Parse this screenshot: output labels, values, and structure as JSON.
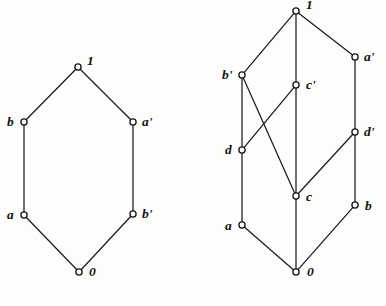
{
  "figure": {
    "background_color": "#fdfdfc",
    "line_color": "#1b1b1b",
    "node_fill": "#fdfdfc",
    "node_stroke": "#141414"
  },
  "diagrams": [
    {
      "id": "left-hexagon-lattice",
      "name": "left-lattice",
      "type": "hasse-diagram",
      "nodes": [
        {
          "id": "one",
          "label": "1",
          "x": 78,
          "y": 67,
          "label_dx": 9,
          "label_dy": -13
        },
        {
          "id": "b",
          "label": "b",
          "x": 24,
          "y": 122,
          "label_dx": -17,
          "label_dy": -7
        },
        {
          "id": "aprime",
          "label": "a'",
          "x": 133,
          "y": 122,
          "label_dx": 9,
          "label_dy": -7
        },
        {
          "id": "a",
          "label": "a",
          "x": 24,
          "y": 215,
          "label_dx": -17,
          "label_dy": -7
        },
        {
          "id": "bprime",
          "label": "b'",
          "x": 133,
          "y": 214,
          "label_dx": 9,
          "label_dy": -7
        },
        {
          "id": "zero",
          "label": "0",
          "x": 79,
          "y": 272,
          "label_dx": 10,
          "label_dy": -7
        }
      ],
      "edges": [
        [
          "b",
          "one"
        ],
        [
          "aprime",
          "one"
        ],
        [
          "b",
          "a"
        ],
        [
          "aprime",
          "bprime"
        ],
        [
          "a",
          "zero"
        ],
        [
          "bprime",
          "zero"
        ]
      ]
    },
    {
      "id": "right-lattice",
      "name": "right-lattice",
      "type": "hasse-diagram",
      "nodes": [
        {
          "id": "one",
          "label": "1",
          "x": 296,
          "y": 11,
          "label_dx": 10,
          "label_dy": -13
        },
        {
          "id": "aprime",
          "label": "a'",
          "x": 355,
          "y": 57,
          "label_dx": 9,
          "label_dy": -7
        },
        {
          "id": "bprime",
          "label": "b'",
          "x": 242,
          "y": 75,
          "label_dx": -20,
          "label_dy": -7
        },
        {
          "id": "cprime",
          "label": "c'",
          "x": 296,
          "y": 85,
          "label_dx": 10,
          "label_dy": -7
        },
        {
          "id": "dprime",
          "label": "d'",
          "x": 355,
          "y": 132,
          "label_dx": 9,
          "label_dy": -7
        },
        {
          "id": "d",
          "label": "d",
          "x": 242,
          "y": 150,
          "label_dx": -17,
          "label_dy": -7
        },
        {
          "id": "c",
          "label": "c",
          "x": 296,
          "y": 196,
          "label_dx": 10,
          "label_dy": -6
        },
        {
          "id": "b",
          "label": "b",
          "x": 355,
          "y": 205,
          "label_dx": 10,
          "label_dy": -6
        },
        {
          "id": "a",
          "label": "a",
          "x": 242,
          "y": 225,
          "label_dx": -17,
          "label_dy": -6
        },
        {
          "id": "zero",
          "label": "0",
          "x": 296,
          "y": 272,
          "label_dx": 11,
          "label_dy": -7
        }
      ],
      "edges": [
        [
          "bprime",
          "one"
        ],
        [
          "cprime",
          "one"
        ],
        [
          "aprime",
          "one"
        ],
        [
          "d",
          "bprime"
        ],
        [
          "c",
          "bprime"
        ],
        [
          "d",
          "cprime"
        ],
        [
          "c",
          "cprime"
        ],
        [
          "dprime",
          "aprime"
        ],
        [
          "c",
          "dprime"
        ],
        [
          "b",
          "dprime"
        ],
        [
          "a",
          "d"
        ],
        [
          "zero",
          "c"
        ],
        [
          "zero",
          "b"
        ],
        [
          "zero",
          "a"
        ]
      ]
    }
  ]
}
